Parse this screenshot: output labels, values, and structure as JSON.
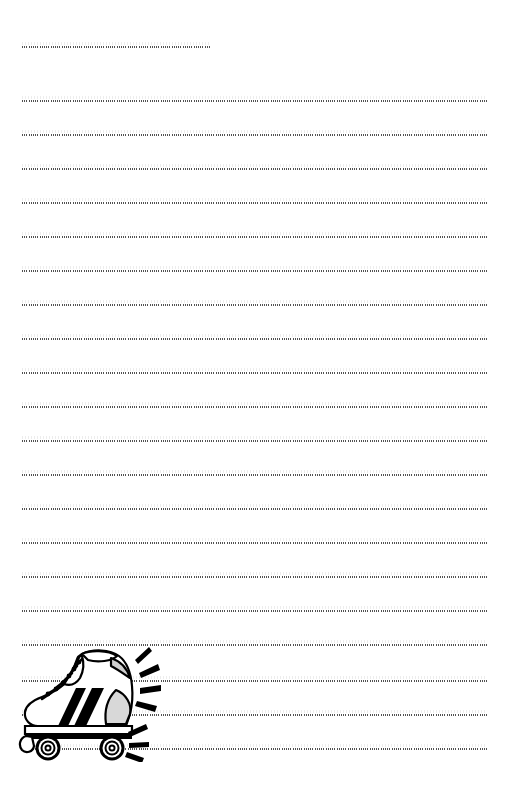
{
  "page": {
    "background_color": "#ffffff",
    "width": 510,
    "height": 786,
    "paper_type": "handwriting-practice-sheet",
    "ink_color": "#2b2b2b"
  },
  "rules": {
    "line_style": "dotted",
    "count": 21,
    "left_margin_px": 22,
    "right_margin_px": 487,
    "spacing_px": 34,
    "first_line_top_px": 46,
    "items": [
      {
        "index": 1,
        "top": 46,
        "left": 22,
        "width": 188,
        "label": "name-line"
      },
      {
        "index": 2,
        "top": 100,
        "left": 22,
        "width": 465,
        "label": "writing-line-1"
      },
      {
        "index": 3,
        "top": 134,
        "left": 22,
        "width": 465,
        "label": "writing-line-2"
      },
      {
        "index": 4,
        "top": 168,
        "left": 22,
        "width": 465,
        "label": "writing-line-3"
      },
      {
        "index": 5,
        "top": 202,
        "left": 22,
        "width": 465,
        "label": "writing-line-4"
      },
      {
        "index": 6,
        "top": 236,
        "left": 22,
        "width": 465,
        "label": "writing-line-5"
      },
      {
        "index": 7,
        "top": 270,
        "left": 22,
        "width": 465,
        "label": "writing-line-6"
      },
      {
        "index": 8,
        "top": 304,
        "left": 22,
        "width": 465,
        "label": "writing-line-7"
      },
      {
        "index": 9,
        "top": 338,
        "left": 22,
        "width": 465,
        "label": "writing-line-8"
      },
      {
        "index": 10,
        "top": 372,
        "left": 22,
        "width": 465,
        "label": "writing-line-9"
      },
      {
        "index": 11,
        "top": 406,
        "left": 22,
        "width": 465,
        "label": "writing-line-10"
      },
      {
        "index": 12,
        "top": 440,
        "left": 22,
        "width": 465,
        "label": "writing-line-11"
      },
      {
        "index": 13,
        "top": 474,
        "left": 22,
        "width": 465,
        "label": "writing-line-12"
      },
      {
        "index": 14,
        "top": 508,
        "left": 22,
        "width": 465,
        "label": "writing-line-13"
      },
      {
        "index": 15,
        "top": 542,
        "left": 22,
        "width": 465,
        "label": "writing-line-14"
      },
      {
        "index": 16,
        "top": 576,
        "left": 22,
        "width": 465,
        "label": "writing-line-15"
      },
      {
        "index": 17,
        "top": 610,
        "left": 22,
        "width": 465,
        "label": "writing-line-16"
      },
      {
        "index": 18,
        "top": 644,
        "left": 22,
        "width": 465,
        "label": "writing-line-17"
      },
      {
        "index": 19,
        "top": 680,
        "left": 22,
        "width": 465,
        "label": "writing-line-18"
      },
      {
        "index": 20,
        "top": 714,
        "left": 22,
        "width": 465,
        "label": "writing-line-19"
      },
      {
        "index": 21,
        "top": 748,
        "left": 22,
        "width": 465,
        "label": "writing-line-20"
      }
    ]
  },
  "illustration": {
    "name": "roller-skate-illustration",
    "description": "Black and white line-art roller skate with high-top laced boot, two dark stripes, four wheels and radiating motion lines",
    "style": "clip-art",
    "outline_color": "#000000",
    "fill_color": "#ffffff",
    "accent_color": "#000000",
    "left": 18,
    "top": 644,
    "width": 150,
    "height": 118,
    "parts": [
      "boot-upper",
      "lace-eyelets",
      "laces",
      "tongue",
      "heel-counter",
      "toe-cap",
      "stripe-front",
      "stripe-rear",
      "sole-plate",
      "front-wheel",
      "rear-wheel",
      "toe-stop",
      "motion-lines-top",
      "motion-lines-rear"
    ]
  }
}
